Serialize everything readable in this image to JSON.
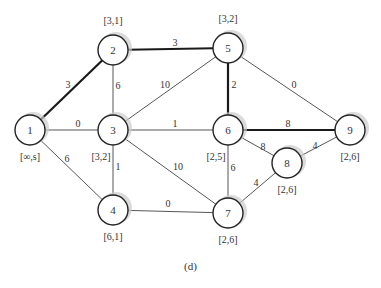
{
  "figure": {
    "caption": "(d)",
    "colors": {
      "edge": "#444444",
      "bold_edge": "#1a1a1a",
      "node_stroke": "#222222",
      "node_fill": "#ffffff",
      "shadow": "#cccccc",
      "text": "#333333"
    },
    "nodes": [
      {
        "id": "1",
        "x": 30,
        "y": 130,
        "label": "[∞,s]",
        "label_dx": 0,
        "label_dy": 30
      },
      {
        "id": "2",
        "x": 113,
        "y": 50,
        "label": "[3,1]",
        "label_dx": 0,
        "label_dy": -26
      },
      {
        "id": "3",
        "x": 113,
        "y": 130,
        "label": "[3,2]",
        "label_dx": -12,
        "label_dy": 30
      },
      {
        "id": "4",
        "x": 113,
        "y": 210,
        "label": "[6,1]",
        "label_dx": 0,
        "label_dy": 30
      },
      {
        "id": "5",
        "x": 228,
        "y": 48,
        "label": "[3,2]",
        "label_dx": 0,
        "label_dy": -26
      },
      {
        "id": "6",
        "x": 228,
        "y": 130,
        "label": "[2,5]",
        "label_dx": -12,
        "label_dy": 30
      },
      {
        "id": "7",
        "x": 228,
        "y": 213,
        "label": "[2,6]",
        "label_dx": 0,
        "label_dy": 30
      },
      {
        "id": "8",
        "x": 287,
        "y": 163,
        "label": "[2,6]",
        "label_dx": 0,
        "label_dy": 30
      },
      {
        "id": "9",
        "x": 350,
        "y": 130,
        "label": "[2,6]",
        "label_dx": 0,
        "label_dy": 30
      }
    ],
    "edges": [
      {
        "from": "1",
        "to": "2",
        "weight": "3",
        "bold": true,
        "lx": 68,
        "ly": 88
      },
      {
        "from": "1",
        "to": "3",
        "weight": "0",
        "bold": false,
        "lx": 78,
        "ly": 127
      },
      {
        "from": "1",
        "to": "4",
        "weight": "6",
        "bold": false,
        "lx": 67,
        "ly": 162
      },
      {
        "from": "2",
        "to": "3",
        "weight": "6",
        "bold": false,
        "lx": 118,
        "ly": 89
      },
      {
        "from": "2",
        "to": "5",
        "weight": "3",
        "bold": true,
        "lx": 175,
        "ly": 46
      },
      {
        "from": "3",
        "to": "5",
        "weight": "10",
        "bold": false,
        "lx": 165,
        "ly": 88
      },
      {
        "from": "3",
        "to": "6",
        "weight": "1",
        "bold": false,
        "lx": 175,
        "ly": 127
      },
      {
        "from": "3",
        "to": "4",
        "weight": "1",
        "bold": false,
        "lx": 118,
        "ly": 170
      },
      {
        "from": "3",
        "to": "7",
        "weight": "10",
        "bold": false,
        "lx": 178,
        "ly": 170
      },
      {
        "from": "5",
        "to": "6",
        "weight": "2",
        "bold": true,
        "lx": 234,
        "ly": 88
      },
      {
        "from": "5",
        "to": "9",
        "weight": "0",
        "bold": false,
        "lx": 294,
        "ly": 88
      },
      {
        "from": "6",
        "to": "9",
        "weight": "8",
        "bold": true,
        "lx": 288,
        "ly": 127
      },
      {
        "from": "6",
        "to": "8",
        "weight": "8",
        "bold": false,
        "lx": 263,
        "ly": 150
      },
      {
        "from": "6",
        "to": "7",
        "weight": "6",
        "bold": false,
        "lx": 233,
        "ly": 171
      },
      {
        "from": "4",
        "to": "7",
        "weight": "0",
        "bold": false,
        "lx": 168,
        "ly": 207
      },
      {
        "from": "7",
        "to": "8",
        "weight": "4",
        "bold": false,
        "lx": 256,
        "ly": 186
      },
      {
        "from": "8",
        "to": "9",
        "weight": "4",
        "bold": false,
        "lx": 315,
        "ly": 149
      }
    ]
  }
}
